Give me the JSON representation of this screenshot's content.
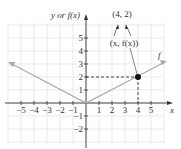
{
  "chart_data": {
    "type": "line",
    "title": "",
    "xlabel": "x",
    "ylabel": "y or f(x)",
    "function_label": "f",
    "function": "f(x) = |x|/2",
    "series": [
      {
        "name": "f",
        "x": [
          -6,
          0,
          6
        ],
        "y": [
          3,
          0,
          3
        ],
        "color": "#aaaaaa"
      }
    ],
    "highlight_point": {
      "x": 4,
      "y": 2,
      "label": "(4, 2)",
      "annotation": "(x, f(x))"
    },
    "x_ticks": [
      -5,
      -4,
      -3,
      -2,
      -1,
      1,
      2,
      3,
      4,
      5
    ],
    "y_ticks": [
      -2,
      -1,
      1,
      2,
      3,
      4,
      5
    ],
    "xlim": [
      -6,
      6.5
    ],
    "ylim": [
      -3,
      6
    ],
    "grid": true
  },
  "labels": {
    "y_axis": "y or f(x)",
    "x_axis": "x",
    "func": "f",
    "point": "(4, 2)",
    "annotation": "(x, f(x))",
    "xt": [
      "−5",
      "−4",
      "−3",
      "−2",
      "−1",
      "1",
      "2",
      "3",
      "4",
      "5"
    ],
    "yt": [
      "5",
      "4",
      "3",
      "2",
      "1",
      "−1",
      "−2"
    ]
  }
}
